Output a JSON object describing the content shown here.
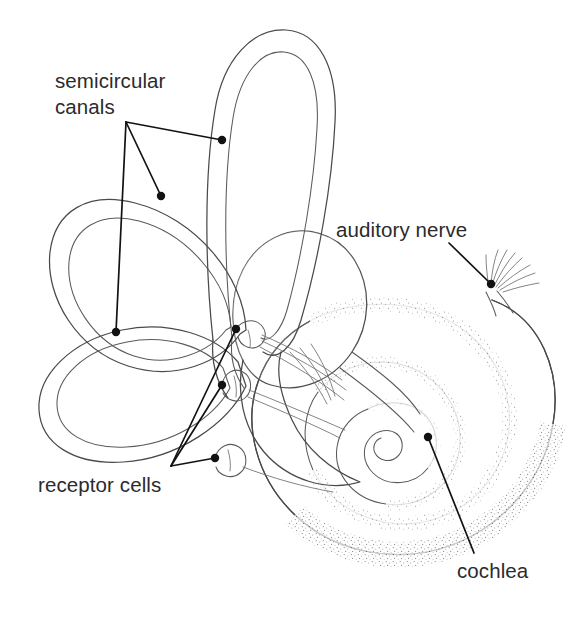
{
  "figure": {
    "style": "black-and-white stippled line drawing",
    "background_color": "#ffffff",
    "line_color": "#4a4a4a",
    "leader_color": "#121212",
    "text_color": "#2b2b2b"
  },
  "labels": [
    {
      "id": "semicircular-canals",
      "line1": "semicircular",
      "line2": "canals",
      "text_x": 55,
      "text_y1": 88,
      "text_y2": 114,
      "leader_origin": {
        "x": 126,
        "y": 122
      },
      "targets": [
        {
          "x": 222,
          "y": 140
        },
        {
          "x": 161,
          "y": 196
        },
        {
          "x": 116,
          "y": 332
        }
      ]
    },
    {
      "id": "auditory-nerve",
      "line1": "auditory nerve",
      "line2": "",
      "text_x": 336,
      "text_y1": 237,
      "text_y2": 0,
      "leader_origin": {
        "x": 449,
        "y": 243
      },
      "targets": [
        {
          "x": 491,
          "y": 284
        }
      ]
    },
    {
      "id": "receptor-cells",
      "line1": "receptor cells",
      "line2": "",
      "text_x": 38,
      "text_y1": 492,
      "text_y2": 0,
      "leader_origin": {
        "x": 171,
        "y": 466
      },
      "targets": [
        {
          "x": 236,
          "y": 329
        },
        {
          "x": 222,
          "y": 385
        },
        {
          "x": 215,
          "y": 458
        }
      ]
    },
    {
      "id": "cochlea",
      "line1": "cochlea",
      "line2": "",
      "text_x": 457,
      "text_y1": 578,
      "text_y2": 0,
      "leader_origin": {
        "x": 474,
        "y": 553
      },
      "targets": [
        {
          "x": 428,
          "y": 437
        }
      ]
    }
  ],
  "structures": [
    {
      "id": "superior-semicircular-canal",
      "name": "superior semicircular canal"
    },
    {
      "id": "posterior-semicircular-canal",
      "name": "posterior semicircular canal"
    },
    {
      "id": "lateral-semicircular-canal",
      "name": "lateral semicircular canal"
    },
    {
      "id": "vestibule",
      "name": "vestibule"
    },
    {
      "id": "cochlea-spiral",
      "name": "cochlea"
    },
    {
      "id": "auditory-nerve-bundle",
      "name": "auditory nerve"
    },
    {
      "id": "ampulla-receptor-1",
      "name": "ampulla with receptor cells"
    },
    {
      "id": "ampulla-receptor-2",
      "name": "ampulla with receptor cells"
    },
    {
      "id": "ampulla-receptor-3",
      "name": "ampulla with receptor cells"
    }
  ]
}
